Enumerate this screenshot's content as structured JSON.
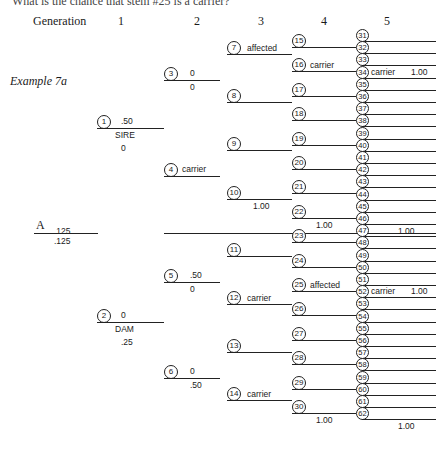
{
  "question": "What is the chance that stem #25 is a carrier?",
  "header": {
    "generation_label": "Generation",
    "generations": [
      "1",
      "2",
      "3",
      "4",
      "5"
    ]
  },
  "example_label": "Example 7a",
  "root": {
    "label": "A",
    "top_value": ".125",
    "bottom_value": ".125"
  },
  "gen1": [
    {
      "id": "1",
      "top": ".50",
      "role": "SIRE",
      "bottom": "0"
    },
    {
      "id": "2",
      "top": "0",
      "role": "DAM",
      "bottom": ".25"
    }
  ],
  "gen2": [
    {
      "id": "3",
      "top": "0",
      "bottom": "0"
    },
    {
      "id": "4",
      "top": "carrier",
      "bottom": ""
    },
    {
      "id": "5",
      "top": ".50",
      "bottom": "0"
    },
    {
      "id": "6",
      "top": "0",
      "bottom": ".50"
    }
  ],
  "gen3": [
    {
      "id": "7",
      "top": "affected",
      "bottom": ""
    },
    {
      "id": "8",
      "top": "",
      "bottom": ""
    },
    {
      "id": "9",
      "top": "",
      "bottom": ""
    },
    {
      "id": "10",
      "top": "",
      "bottom": "1.00"
    },
    {
      "id": "11",
      "top": "",
      "bottom": ""
    },
    {
      "id": "12",
      "top": "carrier",
      "bottom": ""
    },
    {
      "id": "13",
      "top": "",
      "bottom": ""
    },
    {
      "id": "14",
      "top": "carrier",
      "bottom": ""
    }
  ],
  "gen4": [
    {
      "id": "15",
      "top": ""
    },
    {
      "id": "16",
      "top": "carrier"
    },
    {
      "id": "17",
      "top": ""
    },
    {
      "id": "18",
      "top": ""
    },
    {
      "id": "19",
      "top": ""
    },
    {
      "id": "20",
      "top": ""
    },
    {
      "id": "21",
      "top": ""
    },
    {
      "id": "22",
      "top": "",
      "bottom": "1.00"
    },
    {
      "id": "23",
      "top": ""
    },
    {
      "id": "24",
      "top": ""
    },
    {
      "id": "25",
      "top": "affected"
    },
    {
      "id": "26",
      "top": ""
    },
    {
      "id": "27",
      "top": ""
    },
    {
      "id": "28",
      "top": ""
    },
    {
      "id": "29",
      "top": ""
    },
    {
      "id": "30",
      "top": "",
      "bottom": "1.00"
    }
  ],
  "gen5": [
    {
      "id": "31"
    },
    {
      "id": "32"
    },
    {
      "id": "33"
    },
    {
      "id": "34",
      "label": "carrier",
      "value": "1.00"
    },
    {
      "id": "35"
    },
    {
      "id": "36"
    },
    {
      "id": "37"
    },
    {
      "id": "38"
    },
    {
      "id": "39"
    },
    {
      "id": "40"
    },
    {
      "id": "41"
    },
    {
      "id": "42"
    },
    {
      "id": "43"
    },
    {
      "id": "44"
    },
    {
      "id": "45"
    },
    {
      "id": "46",
      "bottom": "1.00"
    },
    {
      "id": "47"
    },
    {
      "id": "48"
    },
    {
      "id": "49"
    },
    {
      "id": "50"
    },
    {
      "id": "51"
    },
    {
      "id": "52",
      "label": "carrier",
      "value": "1.00"
    },
    {
      "id": "53"
    },
    {
      "id": "54"
    },
    {
      "id": "55"
    },
    {
      "id": "56"
    },
    {
      "id": "57"
    },
    {
      "id": "58"
    },
    {
      "id": "59"
    },
    {
      "id": "60"
    },
    {
      "id": "61"
    },
    {
      "id": "62",
      "bottom": "1.00"
    }
  ]
}
